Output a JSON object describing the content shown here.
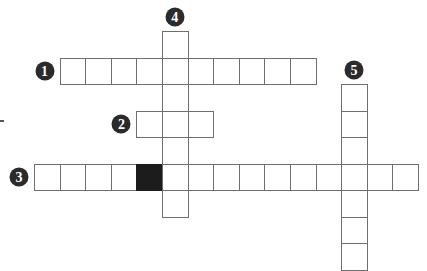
{
  "puzzle": {
    "type": "crossword",
    "colors": {
      "cell_border": "#6e6e6e",
      "black_cell": "#1c1c1c",
      "badge": "#2b2b2b",
      "badge_text": "#ffffff"
    },
    "entries": [
      {
        "number": "1",
        "direction": "across",
        "length": 10,
        "start_col": 1,
        "start_row": 1
      },
      {
        "number": "2",
        "direction": "across",
        "length": 3,
        "start_col": 4,
        "start_row": 3
      },
      {
        "number": "3",
        "direction": "across",
        "length": 15,
        "start_col": 0,
        "start_row": 5,
        "black_index": 4
      },
      {
        "number": "4",
        "direction": "down",
        "length": 7,
        "start_col": 5,
        "start_row": 0
      },
      {
        "number": "5",
        "direction": "down",
        "length": 7,
        "start_col": 12,
        "start_row": 2
      }
    ]
  }
}
